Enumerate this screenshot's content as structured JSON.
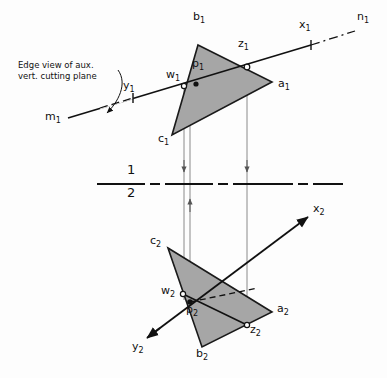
{
  "figure": {
    "type": "orthographic-projection-drawing",
    "caption": "Edge view of aux.\nvert. cutting plane",
    "colors": {
      "background": "#fdfdfd",
      "ink": "#111111",
      "plane_fill": "#a6a6a6",
      "plane_stroke": "#1a1a1a",
      "projector": "#8a8a8a"
    }
  },
  "fold_line": {
    "name": "folding-line-1-2",
    "upper_label": "1",
    "lower_label": "2",
    "y": 184,
    "x_start": 97,
    "x_end": 368,
    "style": "long-dash"
  },
  "top_view": {
    "name": "view-1-horizontal-projection",
    "triangle": {
      "name": "plane-abc-view1",
      "vertices": [
        {
          "label": "b",
          "sub": "1",
          "x": 198,
          "y": 45
        },
        {
          "label": "a",
          "sub": "1",
          "x": 272,
          "y": 82
        },
        {
          "label": "c",
          "sub": "1",
          "x": 172,
          "y": 135
        }
      ],
      "labels": [
        {
          "text": "b",
          "sub": "1",
          "x": 193,
          "y": 18
        },
        {
          "text": "a",
          "sub": "1",
          "x": 278,
          "y": 83
        },
        {
          "text": "c",
          "sub": "1",
          "x": 160,
          "y": 137
        }
      ]
    },
    "line_mn": {
      "name": "line-mn-view1",
      "m_label": {
        "text": "m",
        "sub": "1",
        "x": 48,
        "y": 116
      },
      "n_label": {
        "text": "n",
        "sub": "1",
        "x": 358,
        "y": 16
      },
      "solid_from": {
        "x": 68,
        "y": 118
      },
      "solid_to": {
        "x": 311,
        "y": 45
      },
      "dash_from": {
        "x": 311,
        "y": 45
      },
      "dash_to": {
        "x": 355,
        "y": 31
      }
    },
    "points": [
      {
        "name": "point-y1",
        "label": "y",
        "sub": "1",
        "marker": "tick",
        "x": 133,
        "y": 98,
        "lx": 124,
        "ly": 85
      },
      {
        "name": "point-w1",
        "label": "w",
        "sub": "1",
        "marker": "circle",
        "x": 184,
        "y": 86,
        "lx": 168,
        "ly": 74
      },
      {
        "name": "point-p1",
        "label": "p",
        "sub": "1",
        "marker": "dot",
        "x": 196,
        "y": 84,
        "lx": 194,
        "ly": 64
      },
      {
        "name": "point-z1",
        "label": "z",
        "sub": "1",
        "marker": "circle",
        "x": 247,
        "y": 67,
        "lx": 240,
        "ly": 44
      },
      {
        "name": "point-x1",
        "label": "x",
        "sub": "1",
        "marker": "tick",
        "x": 311,
        "y": 45,
        "lx": 300,
        "ly": 25
      }
    ]
  },
  "front_view": {
    "name": "view-2-frontal-projection",
    "triangle": {
      "name": "plane-abc-view2",
      "vertices": [
        {
          "label": "c",
          "sub": "2",
          "x": 168,
          "y": 248
        },
        {
          "label": "a",
          "sub": "2",
          "x": 272,
          "y": 312
        },
        {
          "label": "b",
          "sub": "2",
          "x": 202,
          "y": 347
        }
      ],
      "labels": [
        {
          "text": "c",
          "sub": "2",
          "x": 152,
          "y": 240
        },
        {
          "text": "a",
          "sub": "2",
          "x": 278,
          "y": 307
        },
        {
          "text": "b",
          "sub": "2",
          "x": 197,
          "y": 351
        }
      ]
    },
    "line_xy": {
      "name": "line-xy-view2",
      "x_label": {
        "text": "x",
        "sub": "2",
        "x": 314,
        "y": 206
      },
      "y_label": {
        "text": "y",
        "sub": "2",
        "x": 134,
        "y": 345
      },
      "from": {
        "x": 146,
        "y": 338
      },
      "to": {
        "x": 310,
        "y": 215
      }
    },
    "cutting_line_wz": {
      "name": "cut-line-w2-z2",
      "from": {
        "x": 183,
        "y": 294
      },
      "to": {
        "x": 247,
        "y": 325
      },
      "style": "solid-then-dashed"
    },
    "points": [
      {
        "name": "point-w2",
        "label": "w",
        "sub": "2",
        "marker": "circle",
        "x": 183,
        "y": 294,
        "lx": 163,
        "ly": 288
      },
      {
        "name": "point-p2",
        "label": "p",
        "sub": "2",
        "marker": "dot",
        "x": 190,
        "y": 302,
        "lx": 190,
        "ly": 306
      },
      {
        "name": "point-z2",
        "label": "z",
        "sub": "2",
        "marker": "circle",
        "x": 247,
        "y": 325,
        "lx": 251,
        "ly": 327
      }
    ]
  },
  "projectors": [
    {
      "name": "projector-w",
      "x": 184,
      "y_top": 88,
      "y_bottom": 300,
      "arrow": "down",
      "arrow_y": 168
    },
    {
      "name": "projector-p",
      "x": 190,
      "y_top": 86,
      "y_bottom": 302,
      "arrow": "up",
      "arrow_y": 200
    },
    {
      "name": "projector-z",
      "x": 247,
      "y_top": 69,
      "y_bottom": 326,
      "arrow": "down",
      "arrow_y": 168
    }
  ],
  "caption_leader": {
    "name": "caption-arrow",
    "from": {
      "x": 117,
      "y": 72
    },
    "to": {
      "x": 105,
      "y": 116
    }
  }
}
